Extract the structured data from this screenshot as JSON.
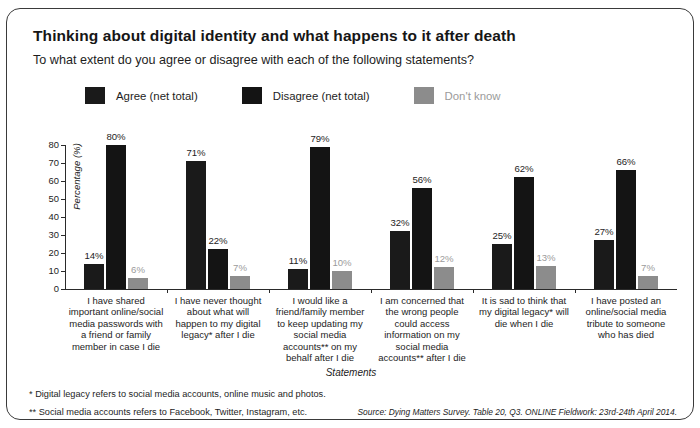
{
  "card": {
    "title": "Thinking about digital identity and what happens to it after death",
    "subtitle": "To what extent do you agree or disagree with each of the following statements?"
  },
  "colors": {
    "agree": "#1a1a1a",
    "disagree": "#141414",
    "dont_know": "#8c8c8c",
    "dont_know_text": "#9b9b9b",
    "axis": "#2a2a2a",
    "border": "#3a3a3a"
  },
  "legend": [
    {
      "label": "Agree (net total)",
      "color": "#1a1a1a",
      "text_color": "#1d1d1d"
    },
    {
      "label": "Disagree (net total)",
      "color": "#141414",
      "text_color": "#1d1d1d"
    },
    {
      "label": "Don't know",
      "color": "#8c8c8c",
      "text_color": "#9b9b9b"
    }
  ],
  "footnotes": {
    "one": "* Digital legacy refers to social media accounts, online music and photos.",
    "two": "** Social media accounts refers to Facebook, Twitter, Instagram, etc."
  },
  "source": "Source: Dying Matters Survey. Table 20, Q3. ONLINE Fieldwork: 23rd-24th April 2014.",
  "chart_data": {
    "type": "bar",
    "title": "Thinking about digital identity and what happens to it after death",
    "subtitle": "To what extent do you agree or disagree with each of the following statements?",
    "xlabel": "Statements",
    "ylabel": "Percentage (%)",
    "ylim": [
      0,
      80
    ],
    "yticks": [
      0,
      10,
      20,
      30,
      40,
      50,
      60,
      70,
      80
    ],
    "ytick_labels": [
      "0",
      "10",
      "20",
      "30",
      "40",
      "50",
      "60",
      "70",
      "80"
    ],
    "grid": false,
    "legend_position": "top",
    "value_suffix": "%",
    "categories": [
      "I have shared important online/social media passwords with a friend or family member in case I die",
      "I have never thought about what will happen to my digital legacy* after I die",
      "I would like a friend/family member to keep updating my social media accounts** on my behalf after I die",
      "I am concerned that the wrong people could access information on my social media accounts** after I die",
      "It is sad to think that my digital legacy* will die when I die",
      "I have posted an online/social media tribute to someone who has died"
    ],
    "series": [
      {
        "name": "Agree (net total)",
        "color": "#1a1a1a",
        "values": [
          14,
          71,
          11,
          32,
          25,
          27
        ],
        "labels": [
          "14%",
          "71%",
          "11%",
          "32%",
          "25%",
          "27%"
        ]
      },
      {
        "name": "Disagree (net total)",
        "color": "#141414",
        "values": [
          80,
          22,
          79,
          56,
          62,
          66
        ],
        "labels": [
          "80%",
          "22%",
          "79%",
          "56%",
          "62%",
          "66%"
        ]
      },
      {
        "name": "Don't know",
        "color": "#8c8c8c",
        "values": [
          6,
          7,
          10,
          12,
          13,
          7
        ],
        "labels": [
          "6%",
          "7%",
          "10%",
          "12%",
          "13%",
          "7%"
        ]
      }
    ]
  }
}
